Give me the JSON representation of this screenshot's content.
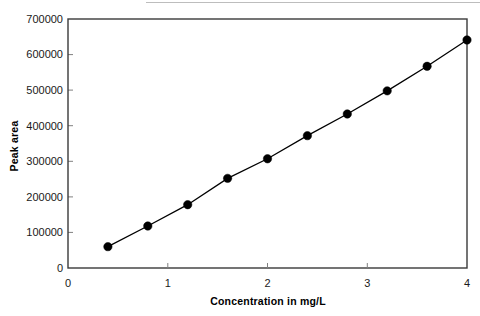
{
  "chart_data": {
    "type": "line",
    "title": "",
    "subtitle": "",
    "xlabel": "Concentration in mg/L",
    "ylabel": "Peak area",
    "xlim": [
      0,
      4
    ],
    "ylim": [
      0,
      700000
    ],
    "xticks": [
      0,
      1,
      2,
      3,
      4
    ],
    "xtick_labels": [
      "0",
      "1",
      "2",
      "3",
      "4"
    ],
    "yticks": [
      0,
      100000,
      200000,
      300000,
      400000,
      500000,
      600000,
      700000
    ],
    "ytick_labels": [
      "0",
      "100000",
      "200000",
      "300000",
      "400000",
      "500000",
      "600000",
      "700000"
    ],
    "grid": false,
    "legend": false,
    "legend_position": "none",
    "marker": "filled-circle",
    "marker_color": "#000000",
    "line_color": "#000000",
    "x": [
      0.4,
      0.8,
      1.2,
      1.6,
      2.0,
      2.4,
      2.8,
      3.2,
      3.6,
      4.0
    ],
    "values": [
      60000,
      118000,
      178000,
      252000,
      307000,
      372000,
      433000,
      498000,
      567000,
      641000
    ],
    "series": [
      {
        "name": "Calibration curve",
        "x": [
          0.4,
          0.8,
          1.2,
          1.6,
          2.0,
          2.4,
          2.8,
          3.2,
          3.6,
          4.0
        ],
        "values": [
          60000,
          118000,
          178000,
          252000,
          307000,
          372000,
          433000,
          498000,
          567000,
          641000
        ]
      }
    ],
    "annotations": []
  }
}
